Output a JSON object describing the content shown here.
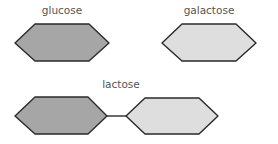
{
  "diagram": {
    "molecules": [
      {
        "name": "glucose",
        "label": "glucose",
        "fill": "#a6a6a6"
      },
      {
        "name": "galactose",
        "label": "galactose",
        "fill": "#dedede"
      }
    ],
    "combined": {
      "label": "lactose",
      "units": [
        {
          "name": "glucose-unit",
          "fill": "#a6a6a6"
        },
        {
          "name": "galactose-unit",
          "fill": "#dedede"
        }
      ],
      "bond": "glycosidic-link"
    },
    "stroke": "#2a2a2a"
  }
}
